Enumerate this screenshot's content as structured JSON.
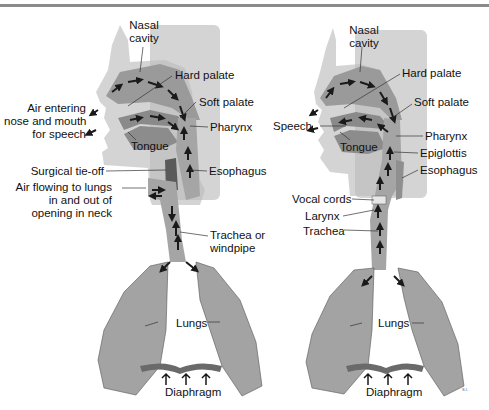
{
  "figure": {
    "left_panel": {
      "description": "Airflow after laryngectomy (breathing through neck stoma)",
      "labels": {
        "nasal_cavity_1": "Nasal",
        "nasal_cavity_2": "cavity",
        "hard_palate": "Hard palate",
        "soft_palate": "Soft palate",
        "pharynx": "Pharynx",
        "tongue": "Tongue",
        "esophagus": "Esophagus",
        "air_entering_1": "Air entering",
        "air_entering_2": "nose and mouth",
        "air_entering_3": "for speech",
        "surgical_tie_off": "Surgical tie-off",
        "air_flowing_1": "Air flowing to lungs",
        "air_flowing_2": "in and out of",
        "air_flowing_3": "opening in neck",
        "trachea_1": "Trachea or",
        "trachea_2": "windpipe",
        "lungs": "Lungs",
        "diaphragm": "Diaphragm"
      }
    },
    "right_panel": {
      "description": "Normal airflow",
      "labels": {
        "nasal_cavity_1": "Nasal",
        "nasal_cavity_2": "cavity",
        "hard_palate": "Hard palate",
        "soft_palate": "Soft palate",
        "speech": "Speech",
        "pharynx": "Pharynx",
        "tongue": "Tongue",
        "epiglottis": "Epiglottis",
        "esophagus": "Esophagus",
        "vocal_cords": "Vocal cords",
        "larynx": "Larynx",
        "trachea": "Trachea",
        "lungs": "Lungs",
        "diaphragm": "Diaphragm"
      }
    },
    "signature": "S.I.",
    "colors": {
      "panel_bg": "#d0d0d0",
      "tissue": "#9a9a9a",
      "lung": "#a3a3a3",
      "arrow": "#1a1a1a",
      "text": "#111111"
    }
  }
}
